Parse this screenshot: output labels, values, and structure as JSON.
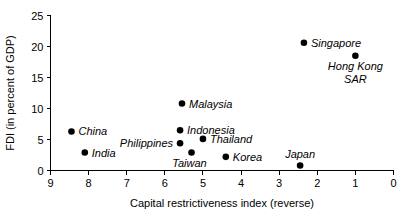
{
  "chart_data": {
    "type": "scatter",
    "title": "",
    "xlabel": "Capital restrictiveness index (reverse)",
    "ylabel": "FDI (in percent of GDP)",
    "xlim": [
      9,
      0
    ],
    "ylim": [
      0,
      25
    ],
    "x_reversed": true,
    "grid": false,
    "legend": "none",
    "xticks": [
      9,
      8,
      7,
      6,
      5,
      4,
      3,
      2,
      1,
      0
    ],
    "xtick_labels": [
      "9",
      "8",
      "7",
      "6",
      "5",
      "4",
      "3",
      "2",
      "1",
      "0"
    ],
    "yticks": [
      0,
      5,
      10,
      15,
      20,
      25
    ],
    "ytick_labels": [
      "0",
      "5",
      "10",
      "15",
      "20",
      "25"
    ],
    "points": [
      {
        "label": "China",
        "x": 8.45,
        "y": 6.3,
        "label_dx": 7,
        "label_dy": 4,
        "label_anchor": "start"
      },
      {
        "label": "India",
        "x": 8.1,
        "y": 2.9,
        "label_dx": 7,
        "label_dy": 4,
        "label_anchor": "start"
      },
      {
        "label": "Malaysia",
        "x": 5.55,
        "y": 10.8,
        "label_dx": 7,
        "label_dy": 4,
        "label_anchor": "start"
      },
      {
        "label": "Indonesia",
        "x": 5.6,
        "y": 6.5,
        "label_dx": 7,
        "label_dy": 4,
        "label_anchor": "start"
      },
      {
        "label": "Philippines",
        "x": 5.6,
        "y": 4.4,
        "label_dx": -7,
        "label_dy": 4,
        "label_anchor": "end"
      },
      {
        "label": "Thailand",
        "x": 5.0,
        "y": 5.1,
        "label_dx": 7,
        "label_dy": 4,
        "label_anchor": "start"
      },
      {
        "label": "Taiwan",
        "x": 5.3,
        "y": 2.9,
        "label_dx": -2,
        "label_dy": 14,
        "label_anchor": "middle"
      },
      {
        "label": "Korea",
        "x": 4.4,
        "y": 2.2,
        "label_dx": 7,
        "label_dy": 4,
        "label_anchor": "start"
      },
      {
        "label": "Japan",
        "x": 2.45,
        "y": 0.8,
        "label_dx": 0,
        "label_dy": -8,
        "label_anchor": "middle"
      },
      {
        "label": "Singapore",
        "x": 2.35,
        "y": 20.6,
        "label_dx": 7,
        "label_dy": 4,
        "label_anchor": "start"
      },
      {
        "label": "Hong Kong SAR",
        "x": 1.0,
        "y": 18.5,
        "label_dx": 0,
        "label_dy": 14,
        "label_anchor": "middle",
        "label_lines": [
          "Hong Kong",
          "SAR"
        ]
      }
    ]
  },
  "style": {
    "axis_color": "#000000",
    "point_color": "#000000",
    "background": "#ffffff"
  }
}
